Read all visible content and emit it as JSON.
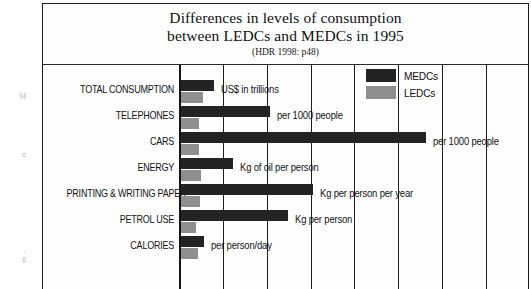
{
  "margin_bleed": {
    "fragment_1": "M",
    "fragment_2": "n",
    "fragment_3": "P",
    "fragment_4": ",\ng"
  },
  "figure": {
    "title_line_1": "Differences in levels of consumption",
    "title_line_2": "between LEDCs and MEDCs in 1995",
    "source": "(HDR 1998: p48)"
  },
  "legend": {
    "position": "top-right",
    "items": [
      {
        "label": "MEDCs",
        "color": "#232323",
        "swatch": "legend-swatch-medc"
      },
      {
        "label": "LEDCs",
        "color": "#8f8f8f",
        "swatch": "legend-swatch-ledc"
      }
    ]
  },
  "chart_data": {
    "type": "bar",
    "orientation": "horizontal",
    "title": "Differences in levels of consumption between LEDCs and MEDCs in 1995",
    "subtitle": "(HDR 1998: p48)",
    "source": "(HDR 1998: p48)",
    "xlabel": "",
    "ylabel": "",
    "grid": true,
    "grid_axis": "x",
    "legend_position": "top-right",
    "categories": [
      "TOTAL CONSUMPTION",
      "TELEPHONES",
      "CARS",
      "ENERGY",
      "PRINTING & WRITING PAPER",
      "PETROL USE",
      "CALORIES"
    ],
    "unit_annotations": [
      "US$ in trillions",
      "per 1000 people",
      "per 1000 people",
      "Kg of oil per person",
      "Kg per person per year",
      "Kg per person",
      "per person/day"
    ],
    "series": [
      {
        "name": "MEDCs",
        "color": "#232323",
        "values": [
          33,
          90,
          245,
          53,
          133,
          107,
          23
        ]
      },
      {
        "name": "LEDCs",
        "color": "#8f8f8f",
        "values": [
          22,
          18,
          18,
          20,
          19,
          15,
          17
        ]
      }
    ],
    "xlim": [
      0,
      300
    ],
    "bar_pixel_lengths": {
      "medc": [
        34,
        90,
        246,
        53,
        133,
        108,
        24
      ],
      "ledc": [
        23,
        19,
        19,
        21,
        20,
        16,
        18
      ]
    },
    "gridline_positions_px": [
      222,
      266,
      310,
      353,
      397,
      441,
      485
    ]
  }
}
